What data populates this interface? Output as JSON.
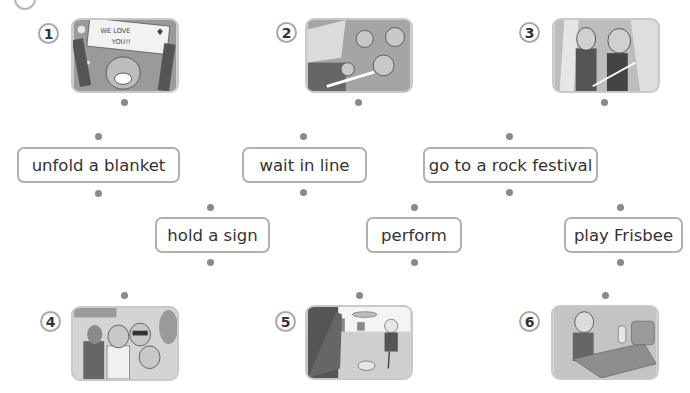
{
  "exercise": {
    "instruction_marker": "circle-marker",
    "pictures": [
      {
        "number": "1",
        "description": "Person holding a sign reading WE LOVE YOU",
        "sign_text_line1": "WE LOVE",
        "sign_text_line2": "YOU!!"
      },
      {
        "number": "2",
        "description": "Excited people waiting in a line at a concert"
      },
      {
        "number": "3",
        "description": "Two performers on stage with a guitar"
      },
      {
        "number": "4",
        "description": "Group of friends in front of a ticket booth"
      },
      {
        "number": "5",
        "description": "Girl throwing a Frisbee in a park"
      },
      {
        "number": "6",
        "description": "Girl unfolding a blanket next to a bag"
      }
    ],
    "phrases": [
      {
        "id": "unfold-a-blanket",
        "label": "unfold a blanket"
      },
      {
        "id": "wait-in-line",
        "label": "wait in line"
      },
      {
        "id": "go-to-a-rock-festival",
        "label": "go to a rock festival"
      },
      {
        "id": "hold-a-sign",
        "label": "hold a sign"
      },
      {
        "id": "perform",
        "label": "perform"
      },
      {
        "id": "play-frisbee",
        "label": "play Frisbee"
      }
    ]
  }
}
